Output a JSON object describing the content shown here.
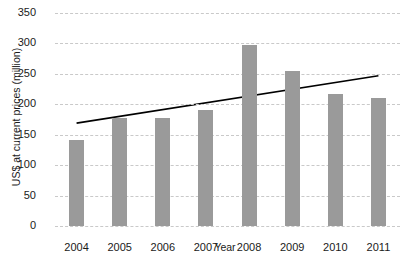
{
  "chart_data": {
    "type": "bar",
    "title": "",
    "xlabel": "Year",
    "ylabel": "US$ at current prices (million)",
    "categories": [
      "2004",
      "2005",
      "2006",
      "2007",
      "2008",
      "2009",
      "2010",
      "2011"
    ],
    "values": [
      141,
      177,
      178,
      191,
      297,
      255,
      217,
      211
    ],
    "ylim": [
      0,
      350
    ],
    "yticks": [
      0,
      50,
      100,
      150,
      200,
      250,
      300,
      350
    ],
    "ytick_labels": [
      "0",
      "50",
      "100",
      "150",
      "200",
      "250",
      "300",
      "350"
    ],
    "grid": true,
    "legend": "none",
    "series": [
      {
        "name": "US$ at current prices (million)",
        "type": "bar",
        "color": "#9a9a9a",
        "values": [
          141,
          177,
          178,
          191,
          297,
          255,
          217,
          211
        ]
      },
      {
        "name": "Linear trend",
        "type": "line",
        "color": "#000000",
        "start_value": 169,
        "end_value": 247
      }
    ]
  }
}
